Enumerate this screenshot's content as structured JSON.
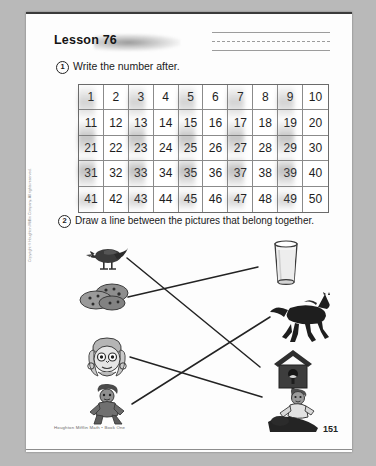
{
  "page": {
    "lesson_title": "Lesson 76",
    "page_number": "151",
    "footer_credit": "Houghton Mifflin Math • Book One",
    "side_copyright": "Copyright © Houghton Mifflin Company. All rights reserved."
  },
  "exercise1": {
    "number": "1",
    "instruction": "Write the number after.",
    "grid": {
      "rows": [
        [
          "1",
          "2",
          "3",
          "4",
          "5",
          "6",
          "7",
          "8",
          "9",
          "10"
        ],
        [
          "11",
          "12",
          "13",
          "14",
          "15",
          "16",
          "17",
          "18",
          "19",
          "20"
        ],
        [
          "21",
          "22",
          "23",
          "24",
          "25",
          "26",
          "27",
          "28",
          "29",
          "30"
        ],
        [
          "31",
          "32",
          "33",
          "34",
          "35",
          "36",
          "37",
          "38",
          "39",
          "40"
        ],
        [
          "41",
          "42",
          "43",
          "44",
          "45",
          "46",
          "47",
          "48",
          "49",
          "50"
        ]
      ],
      "columns": 10,
      "row_count": 5
    }
  },
  "exercise2": {
    "number": "2",
    "instruction": "Draw a line between the pictures that belong together.",
    "left_pictures": [
      {
        "name": "bird",
        "label": "bird"
      },
      {
        "name": "cookies",
        "label": "cookies"
      },
      {
        "name": "girl-face",
        "label": "girl"
      },
      {
        "name": "seated-child",
        "label": "child"
      }
    ],
    "right_pictures": [
      {
        "name": "glass-of-milk",
        "label": "glass of milk"
      },
      {
        "name": "horse",
        "label": "horse"
      },
      {
        "name": "birdhouse",
        "label": "birdhouse"
      },
      {
        "name": "girl-riding-horse",
        "label": "girl riding horse"
      }
    ],
    "connections": [
      {
        "from": "bird",
        "to": "birdhouse"
      },
      {
        "from": "cookies",
        "to": "glass-of-milk"
      },
      {
        "from": "girl-face",
        "to": "girl-riding-horse"
      },
      {
        "from": "seated-child",
        "to": "horse"
      }
    ]
  },
  "colors": {
    "ink": "#1a1a1a",
    "rule": "#8b8b8b",
    "paper": "#fdfdfd",
    "backdrop": "#b9b9b9"
  }
}
